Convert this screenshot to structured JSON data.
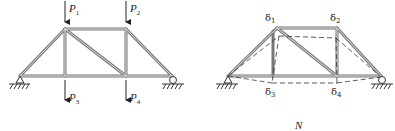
{
  "figure": {
    "left_truss": {
      "loads_top": [
        {
          "symbol": "P",
          "sub": "1"
        },
        {
          "symbol": "P",
          "sub": "2"
        }
      ],
      "loads_bottom": [
        {
          "symbol": "P",
          "sub": "3"
        },
        {
          "symbol": "P",
          "sub": "4"
        }
      ]
    },
    "right_truss": {
      "deflections_top": [
        {
          "symbol": "δ",
          "sub": "1"
        },
        {
          "symbol": "δ",
          "sub": "2"
        }
      ],
      "deflections_bottom": [
        {
          "symbol": "δ",
          "sub": "3"
        },
        {
          "symbol": "δ",
          "sub": "4"
        }
      ]
    },
    "caption": "N"
  },
  "colors": {
    "member": "#6e6e6e",
    "line": "#333333",
    "background": "#ffffff"
  }
}
